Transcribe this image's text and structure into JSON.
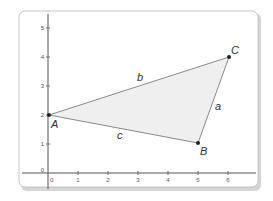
{
  "diagram": {
    "type": "coordinate-plane-triangle",
    "colors": {
      "card_background": "#ffffff",
      "card_border": "#b8b8b8",
      "card_shadow": "#cfcfcf",
      "axis": "#555555",
      "triangle_fill": "#efefef",
      "triangle_stroke": "#8a8a8a",
      "point": "#222222"
    },
    "x_axis": {
      "ticks": [
        "0",
        "1",
        "2",
        "3",
        "4",
        "5",
        "6"
      ]
    },
    "y_axis": {
      "ticks": [
        "0",
        "1",
        "2",
        "3",
        "4",
        "5"
      ]
    },
    "vertices": [
      {
        "label": "A",
        "x": 0,
        "y": 2
      },
      {
        "label": "B",
        "x": 5,
        "y": 1
      },
      {
        "label": "C",
        "x": 6,
        "y": 4
      }
    ],
    "sides": [
      {
        "label": "a",
        "between": "B-C"
      },
      {
        "label": "b",
        "between": "A-C"
      },
      {
        "label": "c",
        "between": "A-B"
      }
    ]
  }
}
